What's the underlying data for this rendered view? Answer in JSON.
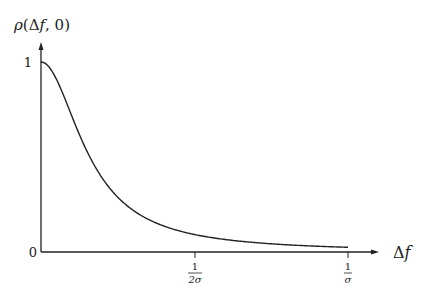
{
  "chart_data": {
    "type": "line",
    "title": "",
    "ylabel": "ρ(Δf, 0)",
    "xlabel": "Δf",
    "y_ticks": [
      {
        "value": 0,
        "label": "0"
      },
      {
        "value": 1,
        "label": "1"
      }
    ],
    "x_ticks": [
      {
        "value": 0.5,
        "label_num": "1",
        "label_den": "2σ",
        "label": "1/(2σ)"
      },
      {
        "value": 1.0,
        "label_num": "1",
        "label_den": "σ",
        "label": "1/σ"
      }
    ],
    "xlim": [
      0,
      1.0
    ],
    "ylim": [
      0,
      1
    ],
    "grid": false,
    "legend": null,
    "series": [
      {
        "name": "ρ(Δf, 0)",
        "description": "Monotonically decreasing, Lorentzian-like: ρ = 1/(1+(2πσΔf)²)",
        "x": [
          0,
          0.05,
          0.1,
          0.159,
          0.2,
          0.25,
          0.3,
          0.4,
          0.5,
          0.6,
          0.7,
          0.8,
          0.9,
          1.0
        ],
        "values": [
          1.0,
          0.91,
          0.717,
          0.5,
          0.388,
          0.288,
          0.22,
          0.137,
          0.092,
          0.066,
          0.049,
          0.038,
          0.03,
          0.025
        ]
      }
    ]
  },
  "labels": {
    "y_axis": "ρ(Δf, 0)",
    "x_axis": "Δf",
    "y_tick_1": "1",
    "y_tick_0": "0",
    "x_tick_half_num": "1",
    "x_tick_half_den": "2σ",
    "x_tick_one_num": "1",
    "x_tick_one_den": "σ"
  }
}
